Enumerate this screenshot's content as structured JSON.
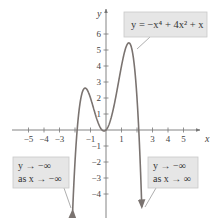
{
  "chart_data": {
    "type": "line",
    "title": "",
    "function": "y = -x^4 + 4x^2 + x",
    "xlabel": "x",
    "ylabel": "y",
    "xlim": [
      -5.5,
      5.8
    ],
    "ylim": [
      -5,
      7
    ],
    "x_ticks": [
      -5,
      -4,
      -3,
      -1,
      1,
      3,
      4,
      5
    ],
    "y_ticks": [
      6,
      5,
      4,
      3,
      2,
      1,
      -1,
      -2,
      -3,
      -4
    ],
    "grid": false,
    "legend": null,
    "series": [
      {
        "name": "y = -x^4 + 4x^2 + x",
        "x": [
          -2.3,
          -2.1,
          -2.0,
          -1.8,
          -1.5,
          -1.33,
          -1.2,
          -1.0,
          -0.8,
          -0.6,
          -0.4,
          -0.2,
          -0.12,
          0.0,
          0.2,
          0.4,
          0.6,
          0.8,
          1.0,
          1.2,
          1.46,
          1.6,
          1.8,
          2.0,
          2.1,
          2.3
        ],
        "values": [
          -7.13,
          -3.99,
          -2.0,
          0.86,
          2.44,
          2.58,
          2.48,
          2.0,
          1.35,
          0.71,
          0.22,
          -0.04,
          -0.06,
          0.0,
          0.36,
          1.01,
          1.91,
          2.95,
          4.0,
          4.89,
          5.42,
          5.28,
          3.86,
          2.0,
          0.29,
          -5.58
        ]
      }
    ],
    "key_points": {
      "local_max_left": [
        -1.33,
        2.58
      ],
      "local_min": [
        -0.12,
        -0.06
      ],
      "local_max_right": [
        1.46,
        5.42
      ],
      "x_intercepts": [
        -1.86,
        0,
        2.11
      ]
    },
    "annotations": [
      {
        "id": "equation",
        "text": "y = −x⁴ + 4x² + x"
      },
      {
        "id": "left-end",
        "lines": [
          "y → −∞",
          "as x → −∞"
        ]
      },
      {
        "id": "right-end",
        "lines": [
          "y → −∞",
          "as x → ∞"
        ]
      }
    ]
  },
  "axes": {
    "x_label": "x",
    "y_label": "y",
    "x_tick_labels": [
      "−5",
      "−4",
      "−3",
      "−1",
      "1",
      "3",
      "4",
      "5"
    ],
    "y_tick_labels": [
      "6",
      "5",
      "4",
      "3",
      "2",
      "1",
      "−1",
      "−2",
      "−3",
      "−4"
    ]
  },
  "callouts": {
    "equation": "y = −x⁴ + 4x² + x",
    "left_line1": "y → −∞",
    "left_line2": "as x → −∞",
    "right_line1": "y → −∞",
    "right_line2": "as x → ∞"
  },
  "colors": {
    "curve": "#7a7370",
    "axis": "#777777",
    "callout_fill": "#e6e6e6",
    "callout_stroke": "#c8c8c8",
    "pointer": "#999999"
  }
}
